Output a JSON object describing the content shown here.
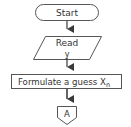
{
  "flowchart": {
    "nodes": [
      {
        "id": "start",
        "type": "terminator",
        "label": "Start"
      },
      {
        "id": "read",
        "type": "input-output",
        "label": "Read",
        "sublabel": "y"
      },
      {
        "id": "guess",
        "type": "process",
        "label": "Formulate a guess X",
        "subscript": "n"
      },
      {
        "id": "connector-a",
        "type": "off-page-connector",
        "label": "A"
      }
    ],
    "edges": [
      {
        "from": "start",
        "to": "read"
      },
      {
        "from": "read",
        "to": "guess"
      },
      {
        "from": "guess",
        "to": "connector-a"
      }
    ]
  },
  "colors": {
    "stroke": "#555555",
    "arrow": "#3a3a3a",
    "text": "#333333",
    "background": "#ffffff"
  }
}
